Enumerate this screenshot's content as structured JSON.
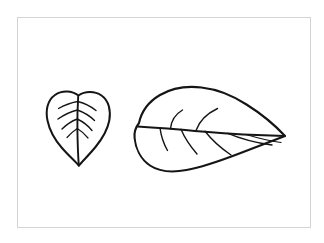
{
  "document": {
    "title": "Leaf Line Drawing",
    "background_color": "#ffffff",
    "medium": "black ink line drawing",
    "subject": "two leaves"
  },
  "frame": {
    "name": "card-border",
    "stroke_color": "#d4d4d4",
    "fill_color": "#ffffff",
    "x": 17,
    "y": 17,
    "width": 294,
    "height": 211
  },
  "ink": {
    "color": "#151515",
    "outline_width": 2.1,
    "vein_width": 1.4
  },
  "figures": [
    {
      "id": "small-leaf",
      "label": "Small cordate leaf",
      "shape": "heart-shaped (cordate)",
      "orientation": "tip pointing down",
      "bounds": {
        "x": 46,
        "y": 91,
        "width": 64,
        "height": 76
      },
      "vein_pairs": 4,
      "has_midrib": true,
      "outline_path": "M 78.5 95.5 C 72 90.5 62 90 55 95 C 47 100.5 45.5 111 47.5 120.5 C 49.5 130.5 55 140 62 148 C 69 156 75.5 161.5 78.8 165.6 C 82.5 161 89 155 95.5 147 C 102 139 107.5 130 109.3 120.5 C 111 111 109 100.5 101.5 95.5 C 94.5 90.8 85 91 78.5 95.5 Z",
      "midrib_path": "M 78.2 96.5 C 77.6 106 77.2 118 77.4 130 C 77.6 142 78 155 78.8 165.6",
      "veins": [
        "M 77.6 101.5 C 72 102.5 64.5 105 58.5 108.5",
        "M 77.6 101.5 C 83.5 103 90.5 106 96 110.5",
        "M 77.4 110 C 71.5 111.5 64.5 114.5 58 119",
        "M 77.4 110 C 83 112 89.5 115.5 94.5 120.5",
        "M 77.3 119 C 72 121 66.5 124.5 62 129",
        "M 77.3 119 C 82.5 121.5 88 125.5 92 130.5",
        "M 77.3 128.5 C 73.5 131 70 134 67 137.5",
        "M 77.3 128.5 C 81.5 131 85 134.5 88 138"
      ]
    },
    {
      "id": "large-leaf",
      "label": "Large ovate leaf",
      "shape": "ovate / elliptical",
      "orientation": "tip pointing right",
      "bounds": {
        "x": 134,
        "y": 87,
        "width": 152,
        "height": 86
      },
      "vein_pairs": 5,
      "has_midrib": true,
      "outline_path": "M 139 123 C 141.5 111 149 101.5 160 95 C 172 88 187 85.8 201.5 87.5 C 217 89.2 232.5 95.5 246.5 104.5 C 260 113 273 123 285 136 C 271 141.5 255 147.5 238 154 C 221 160.5 203 167 186.5 170 C 172 172.8 159 171.5 150 165.5 C 140.5 159 135.5 148 134.6 138 C 134 132.5 135.5 127.5 139 123 Z",
      "midrib_path": "M 137.5 126.5 C 155 127.5 180 129.5 205 131.8 C 232 134.2 262 135.5 285 136",
      "veins": [
        "M 170.5 128.8 C 171 122 175 114.5 182.5 110",
        "M 196 130.5 C 199 122 207 113.5 217.5 108.5",
        "M 160 127.8 C 160.8 134 163 142.5 167.5 150.5",
        "M 181 129.3 C 184 136.5 190 146 197 154",
        "M 205 131.3 C 211 139 220.5 148 231 155",
        "M 228 133.3 C 240 138.5 258 143 272 145",
        "M 246 134.5 C 256 137.5 270 141 281 142.5"
      ]
    }
  ]
}
